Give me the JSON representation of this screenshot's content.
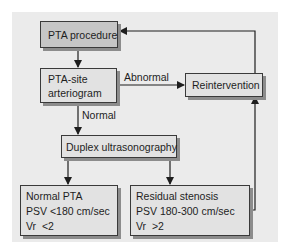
{
  "diagram": {
    "type": "flowchart",
    "colors": {
      "panel_background": "#ebebeb",
      "box_fill": "#e2e2e2",
      "start_box_fill": "#c6c6c6",
      "border": "#3a3a3a",
      "shadow": "#8c8c8c"
    },
    "nodes": {
      "pta_procedure": {
        "label": "PTA procedure"
      },
      "arteriogram": {
        "lines": [
          "PTA-site",
          "arteriogram"
        ]
      },
      "reintervention": {
        "label": "Reintervention"
      },
      "duplex": {
        "label": "Duplex ultrasonography"
      },
      "normal_pta": {
        "lines": [
          "Normal PTA",
          "PSV <180 cm/sec",
          "Vr  <2"
        ]
      },
      "residual_stenosis": {
        "lines": [
          "Residual stenosis",
          "PSV 180-300 cm/sec",
          "Vr  >2"
        ]
      }
    },
    "edges": {
      "abnormal": {
        "label": "Abnormal"
      },
      "normal": {
        "label": "Normal"
      }
    },
    "connections": [
      {
        "from": "PTA procedure",
        "to": "PTA-site arteriogram"
      },
      {
        "from": "PTA-site arteriogram",
        "to": "Reintervention",
        "label": "Abnormal"
      },
      {
        "from": "PTA-site arteriogram",
        "to": "Duplex ultrasonography",
        "label": "Normal"
      },
      {
        "from": "Duplex ultrasonography",
        "to": "Normal PTA"
      },
      {
        "from": "Duplex ultrasonography",
        "to": "Residual stenosis"
      },
      {
        "from": "Residual stenosis",
        "to": "Reintervention"
      },
      {
        "from": "Reintervention",
        "to": "PTA procedure"
      }
    ]
  }
}
